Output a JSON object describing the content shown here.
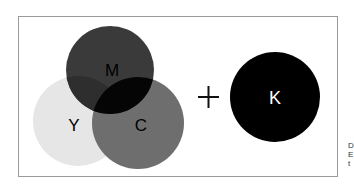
{
  "diagram": {
    "circles": [
      {
        "label": "M",
        "name": "magenta",
        "fill": "#3a3a3a"
      },
      {
        "label": "Y",
        "name": "yellow",
        "fill": "#e6e6e6"
      },
      {
        "label": "C",
        "name": "cyan",
        "fill": "#6e6e6e"
      },
      {
        "label": "K",
        "name": "black",
        "fill": "#000000"
      }
    ],
    "operator": "+",
    "overlap_fill": "#050505"
  },
  "side_text": [
    "D",
    "E",
    "t"
  ]
}
